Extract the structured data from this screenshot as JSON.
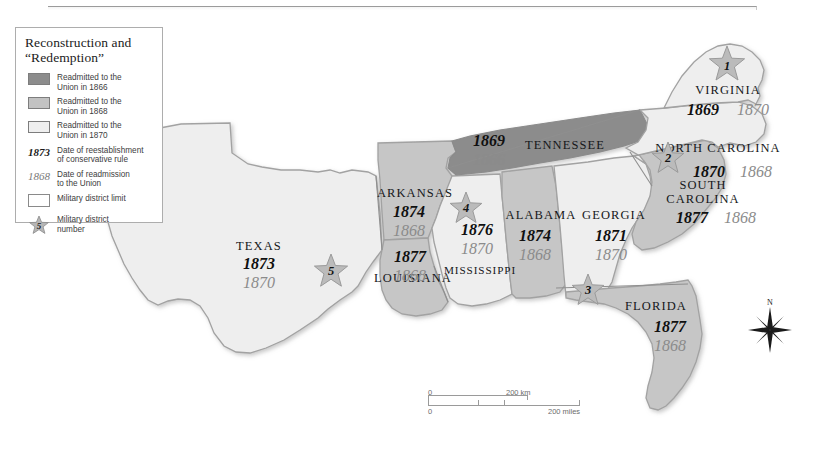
{
  "legend": {
    "title": "Reconstruction and\n“Redemption”",
    "title_line1": "Reconstruction and",
    "title_line2": "“Redemption”",
    "rows": [
      {
        "key": "swatch-dark",
        "label_line1": "Readmitted to the",
        "label_line2": "Union in 1866",
        "color": "#8c8c8c"
      },
      {
        "key": "swatch-medium",
        "label_line1": "Readmitted to the",
        "label_line2": "Union in 1868",
        "color": "#c2c2c2"
      },
      {
        "key": "swatch-light",
        "label_line1": "Readmitted to the",
        "label_line2": "Union in 1870",
        "color": "#efefef"
      },
      {
        "key": "date-bold",
        "sample": "1873",
        "label_line1": "Date of reestablishment",
        "label_line2": "of conservative rule"
      },
      {
        "key": "date-light",
        "sample": "1868",
        "label_line1": "Date of readmission",
        "label_line2": "to the Union"
      },
      {
        "key": "district-limit",
        "label_line1": "Military district limit",
        "label_line2": ""
      },
      {
        "key": "district-star",
        "sample": "5",
        "label_line1": "Military district",
        "label_line2": "number"
      }
    ]
  },
  "map": {
    "states": [
      {
        "name": "TEXAS",
        "conservative_rule": "1873",
        "readmission": "1870",
        "fill": "#eeeeee"
      },
      {
        "name": "ARKANSAS",
        "conservative_rule": "1874",
        "readmission": "1868",
        "fill": "#c6c6c6"
      },
      {
        "name": "LOUISIANA",
        "conservative_rule": "1877",
        "readmission": "1868",
        "fill": "#c6c6c6"
      },
      {
        "name": "MISSISSIPPI",
        "conservative_rule": "1876",
        "readmission": "1870",
        "fill": "#eeeeee"
      },
      {
        "name": "TENNESSEE",
        "conservative_rule": "1869",
        "readmission": "1866",
        "fill": "#8c8c8c"
      },
      {
        "name": "ALABAMA",
        "conservative_rule": "1874",
        "readmission": "1868",
        "fill": "#c6c6c6"
      },
      {
        "name": "GEORGIA",
        "conservative_rule": "1871",
        "readmission": "1870",
        "fill": "#eeeeee"
      },
      {
        "name": "FLORIDA",
        "conservative_rule": "1877",
        "readmission": "1868",
        "fill": "#c6c6c6"
      },
      {
        "name": "SOUTH CAROLINA",
        "conservative_rule": "1877",
        "readmission": "1868",
        "fill": "#c6c6c6"
      },
      {
        "name": "NORTH CAROLINA",
        "conservative_rule": "1870",
        "readmission": "1868",
        "fill": "#eeeeee"
      },
      {
        "name": "VIRGINIA",
        "conservative_rule": "1869",
        "readmission": "1870",
        "fill": "#eeeeee"
      }
    ],
    "districts": [
      {
        "number": "1"
      },
      {
        "number": "2"
      },
      {
        "number": "3"
      },
      {
        "number": "4"
      },
      {
        "number": "5"
      }
    ],
    "state_labels": {
      "texas": "TEXAS",
      "arkansas": "ARKANSAS",
      "louisiana": "LOUISIANA",
      "mississippi": "MISSISSIPPI",
      "tennessee": "TENNESSEE",
      "alabama": "ALABAMA",
      "georgia": "GEORGIA",
      "florida": "FLORIDA",
      "south_carolina_line1": "SOUTH",
      "south_carolina_line2": "CAROLINA",
      "north_carolina": "NORTH CAROLINA",
      "virginia": "VIRGINIA"
    }
  },
  "scalebar": {
    "km_zero": "0",
    "km_label": "200 km",
    "miles_zero": "0",
    "miles_label": "200 miles"
  },
  "compass": {
    "north": "N"
  }
}
